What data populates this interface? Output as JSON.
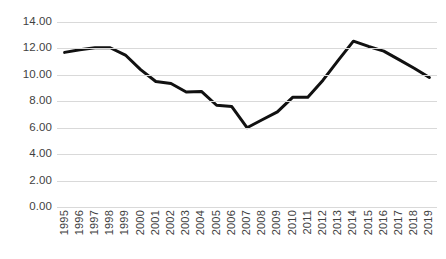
{
  "chart_data": {
    "type": "line",
    "title": "",
    "xlabel": "",
    "ylabel": "",
    "categories": [
      "1995",
      "1996",
      "1997",
      "1998",
      "1999",
      "2000",
      "2001",
      "2002",
      "2003",
      "2004",
      "2005",
      "2006",
      "2007",
      "2008",
      "2009",
      "2010",
      "2011",
      "2012",
      "2013",
      "2014",
      "2015",
      "2016",
      "2017",
      "2018",
      "2019"
    ],
    "values": [
      11.7,
      11.9,
      12.05,
      12.05,
      11.5,
      10.4,
      9.5,
      9.35,
      8.7,
      8.75,
      7.7,
      7.6,
      6.0,
      6.6,
      7.2,
      8.3,
      8.3,
      9.6,
      11.1,
      12.55,
      12.15,
      11.8,
      11.15,
      10.5,
      9.8
    ],
    "series": [
      {
        "name": "series-1",
        "values": [
          11.7,
          11.9,
          12.05,
          12.05,
          11.5,
          10.4,
          9.5,
          9.35,
          8.7,
          8.75,
          7.7,
          7.6,
          6.0,
          6.6,
          7.2,
          8.3,
          8.3,
          9.6,
          11.1,
          12.55,
          12.15,
          11.8,
          11.15,
          10.5,
          9.8
        ],
        "color": "#111111"
      }
    ],
    "ylim": [
      0,
      14
    ],
    "ytick_labels": [
      "0.00",
      "2.00",
      "4.00",
      "6.00",
      "8.00",
      "10.00",
      "12.00",
      "14.00"
    ],
    "ytick_values": [
      0,
      2,
      4,
      6,
      8,
      10,
      12,
      14
    ],
    "grid": true,
    "grid_color": "#d9d9d9",
    "legend": "none",
    "line_width": 3,
    "markers": false,
    "background_color": "#ffffff",
    "axis_text_color": "#3f3f3f"
  }
}
